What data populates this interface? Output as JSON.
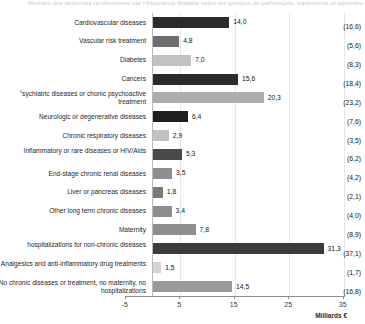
{
  "top_caption": "Montant des depenses remboursees par l'Assurance Maladie selon les groupes de pathologies, traitements et episodes de soins",
  "chart_data": {
    "type": "bar",
    "orientation": "horizontal",
    "title": "",
    "xlabel": "Milliards €",
    "ylabel": "",
    "xlim": [
      -5,
      38
    ],
    "xticks": [
      -5,
      5,
      15,
      25,
      35
    ],
    "xticklabels": [
      "-5",
      "5",
      "15",
      "25",
      "35"
    ],
    "grid": true,
    "legend": false,
    "value_label_format": "comma-decimal",
    "secondary_label_note": "parenthesized values at right",
    "categories": [
      "Cardiovascular diseases",
      "Vascular risk treatment",
      "Diabetes",
      "Cancers",
      "°sychiatric diseases or chonic psychoactive treatment",
      "Neurologic or degenerative diseases",
      "Chronic respiratory diseases",
      "Inflammatory or rare diseases or HIV/Aids",
      "End-stage chronic renal diseases",
      "Liver or pancreas diseases",
      "Other long term chronic diseases",
      "Maternity",
      "hospitalizations for non-chronic diseases",
      "Analgesics and anti-inflammatory drug treatments",
      "No chronic diseases or treatment, no maternity, no  hospitalizations"
    ],
    "values": [
      14.0,
      4.8,
      7.0,
      15.6,
      20.3,
      6.4,
      2.9,
      5.3,
      3.5,
      1.8,
      3.4,
      7.8,
      31.3,
      1.5,
      14.5
    ],
    "value_labels": [
      "14,0",
      "4,8",
      "7,0",
      "15,6",
      "20,3",
      "6,4",
      "2,9",
      "5,3",
      "3,5",
      "1,8",
      "3,4",
      "7,8",
      "31,3",
      "1,5",
      "14,5"
    ],
    "secondary_values": [
      16.6,
      5.6,
      8.3,
      18.4,
      23.2,
      7.6,
      3.5,
      6.2,
      4.2,
      2.1,
      4.0,
      8.9,
      37.1,
      1.7,
      16.8
    ],
    "secondary_labels": [
      "(16,6)",
      "(5,6)",
      "(8,3)",
      "(18,4)",
      "(23,2)",
      "(7,6)",
      "(3,5)",
      "(6,2)",
      "(4,2)",
      "(2,1)",
      "(4,0)",
      "(8,9)",
      "(37,1)",
      "(1,7)",
      "(16,8)"
    ],
    "bar_colors": [
      "#2b2b2b",
      "#6e6e6e",
      "#c2c2c2",
      "#2b2b2b",
      "#adadad",
      "#1f1f1f",
      "#c2c2c2",
      "#4a4a4a",
      "#8e8e8e",
      "#7a7a7a",
      "#8e8e8e",
      "#8e8e8e",
      "#3b3b3b",
      "#d4d4d4",
      "#9a9a9a"
    ]
  }
}
